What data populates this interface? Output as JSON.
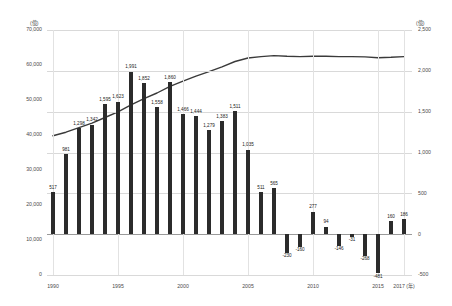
{
  "chart_data": {
    "type": "bar",
    "title": "",
    "subtitle": "",
    "xlabel": "",
    "ylabel": "",
    "x_unit_label": "(年)",
    "left_axis": {
      "unit": "(億)",
      "ticks": [
        "70,000",
        "60,000",
        "50,000",
        "40,000",
        "30,000",
        "20,000",
        "10,000",
        "0"
      ],
      "tick_values": [
        70000,
        60000,
        50000,
        40000,
        30000,
        20000,
        10000,
        0
      ],
      "min": 0,
      "max": 70000
    },
    "right_axis": {
      "unit": "(億)",
      "ticks": [
        "2,500",
        "2,000",
        "1,500",
        "1,000",
        "500",
        "0",
        "-500"
      ],
      "tick_values": [
        2500,
        2000,
        1500,
        1000,
        500,
        0,
        -500
      ],
      "min": -500,
      "max": 2500
    },
    "x_ticks": [
      "1990",
      "1995",
      "2000",
      "2005",
      "2010",
      "2015",
      "2017 (年)"
    ],
    "x_tick_years": [
      1990,
      1995,
      2000,
      2005,
      2010,
      2015,
      2017
    ],
    "categories": [
      1990,
      1991,
      1992,
      1993,
      1994,
      1995,
      1996,
      1997,
      1998,
      1999,
      2000,
      2001,
      2002,
      2003,
      2004,
      2005,
      2006,
      2007,
      2008,
      2009,
      2010,
      2011,
      2012,
      2013,
      2014,
      2015,
      2016,
      2017
    ],
    "grid": true,
    "legend_position": "none",
    "series": [
      {
        "name": "年間増減額",
        "type": "bar",
        "axis": "right",
        "color": "#2b2b2b",
        "values": [
          517,
          981,
          1298,
          1342,
          1595,
          1623,
          1991,
          1852,
          1558,
          1860,
          1466,
          1444,
          1279,
          1383,
          1511,
          1035,
          511,
          565,
          -230,
          -160,
          277,
          94,
          -146,
          -31,
          -268,
          -481,
          160,
          186
        ],
        "labels": [
          "517",
          "981",
          "1,298",
          "1,342",
          "1,595",
          "1,623",
          "1,991",
          "1,852",
          "1,558",
          "1,860",
          "1,466",
          "1,444",
          "1,279",
          "1,383",
          "1,511",
          "1,035",
          "511",
          "565",
          "-230",
          "-160",
          "277",
          "94",
          "-146",
          "-31",
          "-268",
          "-481",
          "160",
          "186"
        ]
      },
      {
        "name": "残高",
        "type": "line",
        "axis": "left",
        "color": "#3a3a3a",
        "values": [
          39800,
          40800,
          42100,
          43400,
          45000,
          46600,
          48600,
          50400,
          52000,
          53900,
          55400,
          56800,
          58100,
          59500,
          61000,
          62000,
          62400,
          62700,
          62500,
          62400,
          62500,
          62500,
          62400,
          62400,
          62300,
          62100,
          62200,
          62400
        ]
      }
    ]
  }
}
